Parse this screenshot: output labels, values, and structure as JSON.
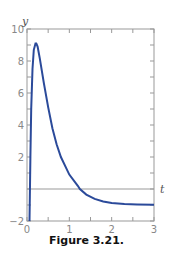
{
  "caption": "Figure 3.21.",
  "colors": {
    "curve": "#2b4a9a",
    "axis": "#888888",
    "frame": "#999999"
  },
  "chart_data": {
    "type": "line",
    "title": "",
    "xlabel": "t",
    "ylabel": "y",
    "xlim": [
      0,
      3
    ],
    "ylim": [
      -2,
      10
    ],
    "x_ticks": [
      "0",
      "1",
      "2",
      "3"
    ],
    "y_ticks": [
      "-2",
      "2",
      "4",
      "6",
      "8",
      "10"
    ],
    "grid": false,
    "legend": null,
    "series": [
      {
        "name": "y(t)",
        "x": [
          0.06,
          0.08,
          0.1,
          0.13,
          0.16,
          0.2,
          0.22,
          0.25,
          0.3,
          0.4,
          0.5,
          0.6,
          0.7,
          0.8,
          1.0,
          1.2,
          1.25,
          1.4,
          1.6,
          1.8,
          2.0,
          2.3,
          2.6,
          3.0
        ],
        "y": [
          -2.0,
          2.0,
          5.0,
          7.5,
          8.7,
          9.1,
          9.1,
          8.9,
          8.2,
          6.6,
          5.1,
          3.8,
          2.8,
          2.0,
          0.9,
          0.2,
          0.0,
          -0.35,
          -0.62,
          -0.78,
          -0.87,
          -0.94,
          -0.97,
          -0.99
        ]
      }
    ],
    "reference_lines": [
      {
        "axis": "y",
        "value": 0
      }
    ]
  }
}
